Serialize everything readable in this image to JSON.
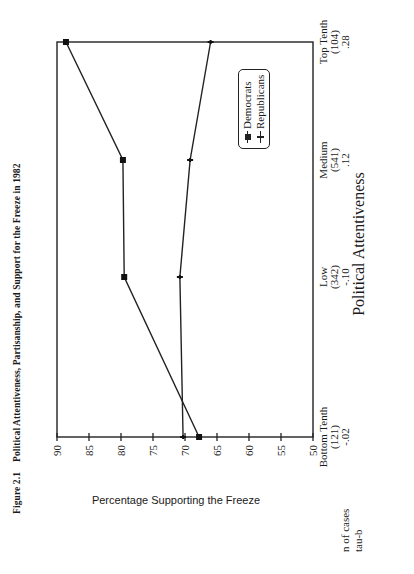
{
  "figure": {
    "number": "Figure 2.1",
    "title": "Political Attentiveness, Partisanship, and Support for the Freeze in 1982"
  },
  "axes": {
    "ylabel": "Percentage Supporting the Freeze",
    "xlabel": "Political Attentiveness",
    "yticks": [
      "90",
      "85",
      "80",
      "75",
      "70",
      "65",
      "60",
      "55",
      "50"
    ]
  },
  "categories": [
    {
      "label": "Bottom Tenth",
      "n": "(121)",
      "tau": "-.02"
    },
    {
      "label": "Low",
      "n": "(342)",
      "tau": "-.10"
    },
    {
      "label": "Medium",
      "n": "(541)",
      "tau": ".12"
    },
    {
      "label": "Top Tenth",
      "n": "(104)",
      "tau": ".28"
    }
  ],
  "row_labels": {
    "n": "n of cases",
    "tau": "tau-b"
  },
  "legend": [
    {
      "label": "Democrats",
      "marker": "filled-square"
    },
    {
      "label": "Republicans",
      "marker": "tick-cross"
    }
  ],
  "chart_data": {
    "type": "line",
    "title": "Political Attentiveness, Partisanship, and Support for the Freeze in 1982",
    "xlabel": "Political Attentiveness",
    "ylabel": "Percentage Supporting the Freeze",
    "categories": [
      "Bottom Tenth",
      "Low",
      "Medium",
      "Top Tenth"
    ],
    "n_of_cases": [
      121,
      342,
      541,
      104
    ],
    "tau_b": [
      -0.02,
      -0.1,
      0.12,
      0.28
    ],
    "series": [
      {
        "name": "Democrats",
        "values": [
          67.8,
          79.5,
          79.7,
          88.6
        ]
      },
      {
        "name": "Republicans",
        "values": [
          70.3,
          70.8,
          69.2,
          66.0
        ]
      }
    ],
    "ylim": [
      50,
      90
    ],
    "yticks": [
      50,
      55,
      60,
      65,
      70,
      75,
      80,
      85,
      90
    ],
    "grid": false,
    "legend_position": "upper right (inside plot)",
    "orientation_note": "page image rotated 90 degrees"
  }
}
